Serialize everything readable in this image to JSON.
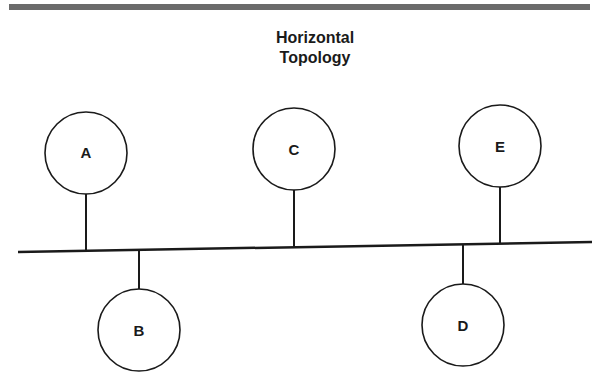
{
  "diagram": {
    "title_line1": "Horizontal",
    "title_line2": "Topology",
    "colors": {
      "line": "#1a1a1a",
      "top_rule": "#6b6b6b",
      "background": "#ffffff"
    },
    "bus": {
      "start": [
        18,
        252
      ],
      "end": [
        592,
        242
      ]
    },
    "nodes": [
      {
        "id": "A",
        "label": "A",
        "position": "above",
        "cx": 86,
        "cy": 153,
        "r": 41,
        "stem_x": 86
      },
      {
        "id": "B",
        "label": "B",
        "position": "below",
        "cx": 139,
        "cy": 330,
        "r": 41,
        "stem_x": 139
      },
      {
        "id": "C",
        "label": "C",
        "position": "above",
        "cx": 294,
        "cy": 149,
        "r": 41,
        "stem_x": 294
      },
      {
        "id": "D",
        "label": "D",
        "position": "below",
        "cx": 463,
        "cy": 325,
        "r": 41,
        "stem_x": 463
      },
      {
        "id": "E",
        "label": "E",
        "position": "above",
        "cx": 500,
        "cy": 146,
        "r": 41,
        "stem_x": 500
      }
    ]
  }
}
